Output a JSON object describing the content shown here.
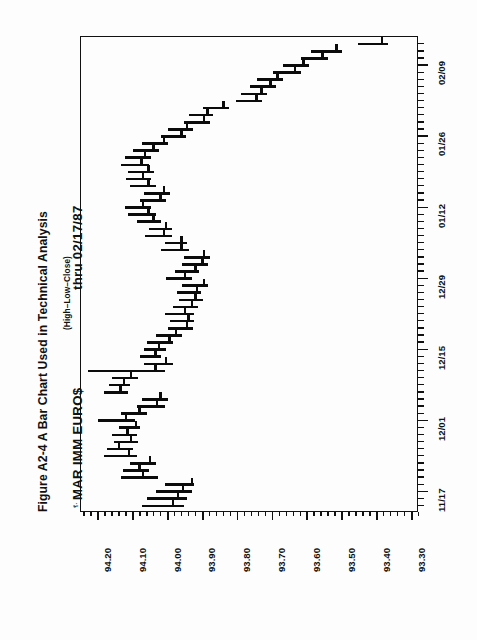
{
  "figure": {
    "caption": "Figure A2-4  A Bar Chart Used in Technical Analysis",
    "instrument": "MAR IMM EURO$",
    "period": "thru 02/17/87",
    "bar_legend": "(High–Low–Close)",
    "corner_glyph": "⸮·"
  },
  "chart_data": {
    "type": "bar",
    "subtype": "hlc-open-high-low-close (rotated 90°)",
    "title": "Figure A2-4  A Bar Chart Used in Technical Analysis",
    "subtitle": "MAR IMM EURO$   thru 02/17/87",
    "annotation": "(High–Low–Close)",
    "orientation": "price axis horizontal (decreasing left→right), date axis vertical (earliest bottom→latest top)",
    "xlabel": "",
    "ylabel": "",
    "grid": false,
    "legend": "none",
    "price_axis": {
      "name": "price",
      "position": "bottom",
      "labels": [
        "94.20",
        "94.10",
        "94.00",
        "93.90",
        "93.80",
        "93.70",
        "93.60",
        "93.50",
        "93.40",
        "93.30"
      ],
      "values": [
        94.2,
        94.1,
        94.0,
        93.9,
        93.8,
        93.7,
        93.6,
        93.5,
        93.4,
        93.3
      ],
      "range": [
        94.25,
        93.28
      ],
      "minor_tick_step": 0.02
    },
    "date_axis": {
      "name": "date",
      "position": "right",
      "labels": [
        "11/17",
        "12/01",
        "12/15",
        "12/29",
        "01/12",
        "01/26",
        "02/09"
      ],
      "label_indices": [
        2,
        12,
        22,
        32,
        42,
        52,
        62
      ],
      "total_bars": 66,
      "minor_tick_step": 1
    },
    "series_name": "MAR IMM EURO$",
    "columns": [
      "index",
      "high",
      "low",
      "close"
    ],
    "bars": [
      [
        0,
        94.075,
        93.955,
        93.99
      ],
      [
        1,
        94.06,
        93.945,
        93.975
      ],
      [
        2,
        94.035,
        93.93,
        93.96
      ],
      [
        3,
        94.01,
        93.925,
        93.935
      ],
      [
        4,
        94.135,
        94.03,
        94.075
      ],
      [
        5,
        94.13,
        94.055,
        94.085
      ],
      [
        6,
        94.11,
        94.035,
        94.055
      ],
      [
        7,
        94.185,
        94.09,
        94.115
      ],
      [
        8,
        94.175,
        94.1,
        94.145
      ],
      [
        9,
        94.155,
        94.085,
        94.11
      ],
      [
        10,
        94.16,
        94.09,
        94.12
      ],
      [
        11,
        94.14,
        94.08,
        94.095
      ],
      [
        12,
        94.2,
        94.095,
        94.125
      ],
      [
        13,
        94.135,
        94.06,
        94.085
      ],
      [
        14,
        94.09,
        94.01,
        94.035
      ],
      [
        15,
        94.075,
        94.0,
        94.025
      ],
      [
        16,
        94.185,
        94.115,
        94.14
      ],
      [
        17,
        94.17,
        94.11,
        94.13
      ],
      [
        18,
        94.16,
        94.085,
        94.11
      ],
      [
        19,
        94.23,
        94.01,
        94.04
      ],
      [
        20,
        94.07,
        93.985,
        94.01
      ],
      [
        21,
        94.08,
        94.02,
        94.04
      ],
      [
        22,
        94.07,
        94.005,
        94.03
      ],
      [
        23,
        94.06,
        93.985,
        94.0
      ],
      [
        24,
        94.035,
        93.96,
        93.98
      ],
      [
        25,
        94.0,
        93.93,
        93.95
      ],
      [
        26,
        93.995,
        93.925,
        93.945
      ],
      [
        27,
        94.01,
        93.925,
        93.955
      ],
      [
        28,
        93.985,
        93.915,
        93.935
      ],
      [
        29,
        93.97,
        93.9,
        93.925
      ],
      [
        30,
        93.975,
        93.905,
        93.92
      ],
      [
        31,
        93.96,
        93.885,
        93.9
      ],
      [
        32,
        94.005,
        93.93,
        93.955
      ],
      [
        33,
        93.98,
        93.91,
        93.925
      ],
      [
        34,
        93.96,
        93.885,
        93.905
      ],
      [
        35,
        93.955,
        93.88,
        93.9
      ],
      [
        36,
        94.02,
        93.94,
        93.965
      ],
      [
        37,
        94.01,
        93.945,
        93.965
      ],
      [
        38,
        94.065,
        93.99,
        94.015
      ],
      [
        39,
        94.055,
        93.99,
        94.01
      ],
      [
        40,
        94.09,
        94.02,
        94.045
      ],
      [
        41,
        94.115,
        94.035,
        94.06
      ],
      [
        42,
        94.125,
        94.05,
        94.075
      ],
      [
        43,
        94.08,
        94.005,
        94.025
      ],
      [
        44,
        94.07,
        93.995,
        94.015
      ],
      [
        45,
        94.11,
        94.035,
        94.06
      ],
      [
        46,
        94.12,
        94.05,
        94.075
      ],
      [
        47,
        94.115,
        94.04,
        94.06
      ],
      [
        48,
        94.135,
        94.055,
        94.08
      ],
      [
        49,
        94.125,
        94.05,
        94.07
      ],
      [
        50,
        94.1,
        94.025,
        94.045
      ],
      [
        51,
        94.075,
        94.0,
        94.015
      ],
      [
        52,
        94.02,
        93.95,
        93.965
      ],
      [
        53,
        94.0,
        93.93,
        93.95
      ],
      [
        54,
        93.955,
        93.88,
        93.9
      ],
      [
        55,
        93.94,
        93.87,
        93.89
      ],
      [
        56,
        93.9,
        93.825,
        93.845
      ],
      [
        57,
        93.805,
        93.73,
        93.75
      ],
      [
        58,
        93.79,
        93.715,
        93.735
      ],
      [
        59,
        93.765,
        93.69,
        93.71
      ],
      [
        60,
        93.745,
        93.67,
        93.69
      ],
      [
        61,
        93.7,
        93.62,
        93.64
      ],
      [
        62,
        93.67,
        93.595,
        93.615
      ],
      [
        63,
        93.62,
        93.54,
        93.56
      ],
      [
        64,
        93.59,
        93.5,
        93.52
      ],
      [
        65,
        93.455,
        93.37,
        93.39
      ]
    ]
  }
}
